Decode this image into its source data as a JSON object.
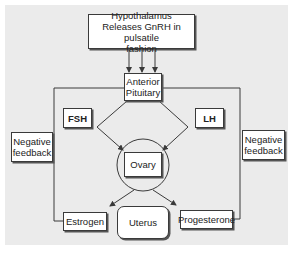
{
  "diagram": {
    "type": "flowchart",
    "nodes": {
      "hypothalamus": {
        "line1": "Hypothalamus",
        "line2": "Releases GnRH in pulsatile",
        "line3": "fashion"
      },
      "anterior_pituitary": {
        "line1": "Anterior",
        "line2": "Pituitary"
      },
      "fsh": {
        "label": "FSH"
      },
      "lh": {
        "label": "LH"
      },
      "ovary": {
        "label": "Ovary"
      },
      "estrogen": {
        "label": "Estrogen"
      },
      "uterus": {
        "label": "Uterus"
      },
      "progesterone": {
        "label": "Progesterone"
      },
      "negative_feedback_left": {
        "line1": "Negative",
        "line2": "feedback"
      },
      "negative_feedback_right": {
        "line1": "Negative",
        "line2": "feedback"
      }
    },
    "edges": [
      {
        "from": "Hypothalamus",
        "to": "Anterior Pituitary",
        "arrows": 3
      },
      {
        "from": "Anterior Pituitary",
        "to": "Ovary",
        "via": "FSH"
      },
      {
        "from": "Anterior Pituitary",
        "to": "Ovary",
        "via": "LH"
      },
      {
        "from": "Ovary",
        "to": "Estrogen"
      },
      {
        "from": "Ovary",
        "to": "Progesterone"
      },
      {
        "from": "Estrogen",
        "to": "Anterior Pituitary",
        "label": "Negative feedback"
      },
      {
        "from": "Progesterone",
        "to": "Anterior Pituitary",
        "label": "Negative feedback"
      }
    ],
    "colors": {
      "background": "#ebebeb",
      "box_fill": "#ffffff",
      "line": "#3a3a3a"
    }
  }
}
